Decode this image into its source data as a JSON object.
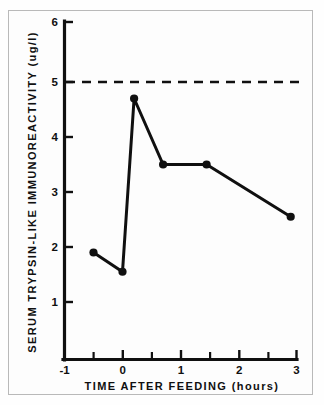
{
  "figure": {
    "background_color": "#fdfdfd",
    "frame_color": "#b9b9b9",
    "ink_color": "#101010"
  },
  "chart_data": {
    "type": "line",
    "title": "",
    "subtitle": "",
    "xlabel": "TIME AFTER FEEDING (hours)",
    "ylabel": "SERUM TRYPSIN-LIKE IMMUNOREACTIVITY (ug/l)",
    "xlim": [
      -1,
      3
    ],
    "ylim": [
      0,
      6
    ],
    "grid": false,
    "legend": "none",
    "x_major_ticks": [
      -1,
      0,
      1,
      2,
      3
    ],
    "x_major_ticklabels": [
      "-1",
      "0",
      "1",
      "2",
      "3"
    ],
    "x_minor_ticks": [
      -0.5,
      0.5,
      1.5,
      2.5
    ],
    "y_major_ticks": [
      1,
      2,
      3,
      4,
      5,
      6
    ],
    "y_major_ticklabels": [
      "1",
      "2",
      "3",
      "4",
      "5",
      "6"
    ],
    "series": [
      {
        "name": "Serum trypsin-like immunoreactivity",
        "marker": "filled-circle",
        "linestyle": "solid",
        "x": [
          -0.5,
          0.0,
          0.2,
          0.7,
          1.45,
          2.9
        ],
        "values": [
          1.9,
          1.55,
          4.7,
          3.5,
          3.5,
          2.55
        ]
      }
    ],
    "annotations": [
      {
        "type": "horizontal-reference-line",
        "name": "upper-reference-limit",
        "y": 5.0,
        "linestyle": "dashed",
        "label": ""
      }
    ]
  }
}
